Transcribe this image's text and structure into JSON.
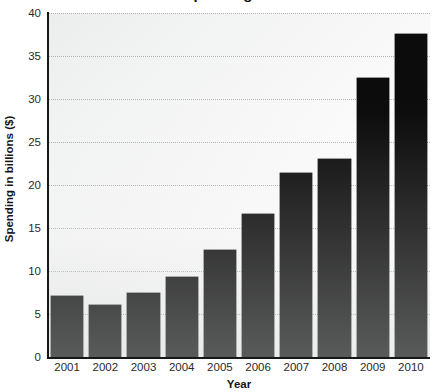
{
  "chart_data": {
    "type": "bar",
    "title": "Spending",
    "xlabel": "Year",
    "ylabel": "Spending in billions ($)",
    "categories": [
      "2001",
      "2002",
      "2003",
      "2004",
      "2005",
      "2006",
      "2007",
      "2008",
      "2009",
      "2010"
    ],
    "values": [
      7.1,
      6.0,
      7.4,
      9.3,
      12.4,
      16.6,
      21.4,
      23.0,
      32.4,
      37.6
    ],
    "ylim": [
      0,
      40
    ],
    "yticks": [
      0,
      5,
      10,
      15,
      20,
      25,
      30,
      35,
      40
    ],
    "ytick_labels": [
      "0",
      "5",
      "10",
      "15",
      "20",
      "25",
      "30",
      "35",
      "40"
    ],
    "grid": true,
    "grid_axis": "y",
    "legend": false,
    "bar_color": "#0c0c0c",
    "plot_background": "#f3f4f4",
    "gridline_color": "#a8a9ab"
  }
}
